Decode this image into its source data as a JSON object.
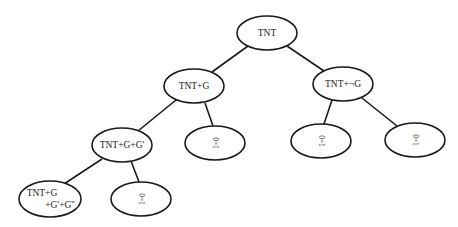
{
  "diagram": {
    "type": "binary-tree",
    "nodes": {
      "root": {
        "label": "TNT"
      },
      "g": {
        "label": "TNT+G"
      },
      "notg": {
        "label": "TNT+¬G"
      },
      "gg": {
        "label": "TNT+G+G'"
      },
      "ggg_line1": {
        "label": "TNT+G"
      },
      "ggg_line2": {
        "label": "+G'+G''"
      },
      "leaf_g": {
        "label": "0=1"
      },
      "leaf_notg_left": {
        "label": "0=1"
      },
      "leaf_notg_right": {
        "label": "0=1"
      },
      "leaf_gg": {
        "label": "0=1"
      }
    },
    "edges": [
      [
        "TNT",
        "TNT+G"
      ],
      [
        "TNT",
        "TNT+¬G"
      ],
      [
        "TNT+G",
        "TNT+G+G'"
      ],
      [
        "TNT+G",
        "0=1"
      ],
      [
        "TNT+¬G",
        "0=1"
      ],
      [
        "TNT+¬G",
        "0=1"
      ],
      [
        "TNT+G+G'",
        "TNT+G+G'+G''"
      ],
      [
        "TNT+G+G'",
        "0=1"
      ]
    ]
  }
}
